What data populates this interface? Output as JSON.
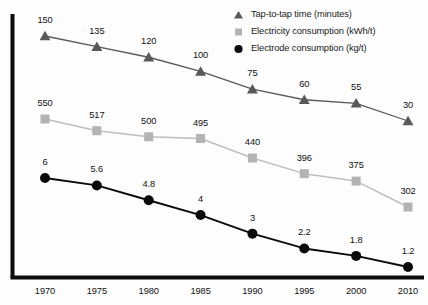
{
  "chart_data": {
    "type": "line",
    "title": "",
    "subtitle": "",
    "xlabel": "",
    "ylabel": "",
    "grid": false,
    "legend_position": "top-right",
    "categories": [
      "1970",
      "1975",
      "1980",
      "1985",
      "1990",
      "1995",
      "2000",
      "2010"
    ],
    "x": [
      1970,
      1975,
      1980,
      1985,
      1990,
      1995,
      2000,
      2010
    ],
    "xlim": [
      1970,
      2010
    ],
    "series": [
      {
        "name": "Tap-to-tap time (minutes)",
        "marker": "triangle",
        "color": "#595959",
        "line_color": "#595959",
        "values": [
          150,
          135,
          120,
          100,
          75,
          60,
          55,
          30
        ],
        "labels": [
          "150",
          "135",
          "120",
          "100",
          "75",
          "60",
          "55",
          "30"
        ],
        "ylim": [
          0,
          175
        ]
      },
      {
        "name": "Electricity consumption (kWh/t)",
        "marker": "square",
        "color": "#b3b3b3",
        "line_color": "#bfbfbf",
        "values": [
          550,
          517,
          500,
          495,
          440,
          396,
          375,
          302
        ],
        "labels": [
          "550",
          "517",
          "500",
          "495",
          "440",
          "396",
          "375",
          "302"
        ],
        "ylim": [
          0,
          640
        ]
      },
      {
        "name": "Electrode consumption (kg/t)",
        "marker": "circle",
        "color": "#0a0a0a",
        "line_color": "#0a0a0a",
        "values": [
          6,
          5.6,
          4.8,
          4,
          3,
          2.2,
          1.8,
          1.2
        ],
        "labels": [
          "6",
          "5.6",
          "4.8",
          "4",
          "3",
          "2.2",
          "1.8",
          "1.2"
        ],
        "ylim": [
          0,
          7
        ]
      }
    ]
  },
  "axes": {
    "x_tick_labels": [
      "1970",
      "1975",
      "1980",
      "1985",
      "1990",
      "1995",
      "2000",
      "2010"
    ],
    "axis_color": "#0d0d0d"
  },
  "legend": {
    "items": [
      {
        "label": "Tap-to-tap time (minutes)",
        "icon": "triangle-marker-icon",
        "color": "#595959"
      },
      {
        "label": "Electricity consumption (kWh/t)",
        "icon": "square-marker-icon",
        "color": "#b3b3b3"
      },
      {
        "label": "Electrode consumption (kg/t)",
        "icon": "circle-marker-icon",
        "color": "#0a0a0a"
      }
    ]
  }
}
